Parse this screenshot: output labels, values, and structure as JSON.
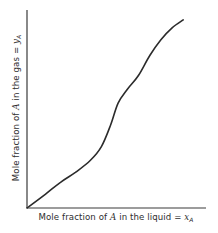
{
  "chart_data": {
    "type": "line",
    "title": "",
    "xlabel": {
      "prefix": "Mole fraction of ",
      "variable": "A",
      "middle": " in the liquid = ",
      "symbol": "x",
      "subscript": "A"
    },
    "ylabel": {
      "prefix": "Mole fraction of ",
      "variable": "A",
      "middle": " in the gas = ",
      "symbol": "y",
      "subscript": "A"
    },
    "xlabel_text": "Mole fraction of A in the liquid = x_A",
    "ylabel_text": "Mole fraction of A in the gas = y_A",
    "xlim": [
      0,
      1
    ],
    "ylim": [
      0,
      1
    ],
    "grid": false,
    "ticks": false,
    "legend": null,
    "series": [
      {
        "name": "equilibrium curve",
        "shape": "S-shaped (sigmoidal)",
        "color": "#2b2b2b",
        "x": [
          0.0,
          0.1,
          0.18,
          0.26,
          0.34,
          0.4,
          0.45,
          0.49,
          0.54,
          0.6,
          0.66,
          0.72,
          0.78,
          0.84
        ],
        "y": [
          0.0,
          0.07,
          0.13,
          0.18,
          0.24,
          0.31,
          0.42,
          0.53,
          0.6,
          0.67,
          0.77,
          0.85,
          0.91,
          0.95
        ]
      }
    ]
  },
  "plot_area": {
    "origin_px": [
      27,
      208
    ],
    "x_axis_end_px": [
      206,
      208
    ],
    "y_axis_top_px": [
      27,
      10
    ]
  },
  "colors": {
    "background": "#ffffff",
    "axis": "#3a3a3a",
    "curve": "#2b2b2b",
    "text": "#2e2e2e"
  }
}
